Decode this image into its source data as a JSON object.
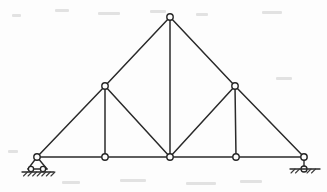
{
  "figure": {
    "type": "truss-line-diagram",
    "canvas": {
      "width": 327,
      "height": 192
    },
    "background_color": "#fdfdfd",
    "member_color": "#2a2a2a",
    "joint_fill_color": "#fdfdfd",
    "joint_stroke_color": "#242424",
    "member_stroke_width": 1.5,
    "joint_radius": 3.2
  },
  "joints": [
    {
      "id": "A",
      "name": "left-support-joint",
      "x": 37,
      "y": 157,
      "label": ""
    },
    {
      "id": "B",
      "name": "bottom-left-joint",
      "x": 105,
      "y": 157,
      "label": ""
    },
    {
      "id": "C",
      "name": "bottom-center-joint",
      "x": 170,
      "y": 157,
      "label": ""
    },
    {
      "id": "D",
      "name": "bottom-right-joint",
      "x": 236,
      "y": 157,
      "label": ""
    },
    {
      "id": "E",
      "name": "right-support-joint",
      "x": 304,
      "y": 157,
      "label": ""
    },
    {
      "id": "F",
      "name": "upper-left-joint",
      "x": 105,
      "y": 86,
      "label": ""
    },
    {
      "id": "G",
      "name": "apex-joint",
      "x": 170,
      "y": 17,
      "label": ""
    },
    {
      "id": "H",
      "name": "upper-right-joint",
      "x": 235,
      "y": 86,
      "label": ""
    }
  ],
  "members": [
    {
      "id": "m1",
      "name": "bottom-chord-A-B",
      "from": "A",
      "to": "B",
      "group": "bottom-chord"
    },
    {
      "id": "m2",
      "name": "bottom-chord-B-C",
      "from": "B",
      "to": "C",
      "group": "bottom-chord"
    },
    {
      "id": "m3",
      "name": "bottom-chord-C-D",
      "from": "C",
      "to": "D",
      "group": "bottom-chord"
    },
    {
      "id": "m4",
      "name": "bottom-chord-D-E",
      "from": "D",
      "to": "E",
      "group": "bottom-chord"
    },
    {
      "id": "m5",
      "name": "top-chord-A-F",
      "from": "A",
      "to": "F",
      "group": "top-chord"
    },
    {
      "id": "m6",
      "name": "top-chord-F-G",
      "from": "F",
      "to": "G",
      "group": "top-chord"
    },
    {
      "id": "m7",
      "name": "top-chord-G-H",
      "from": "G",
      "to": "H",
      "group": "top-chord"
    },
    {
      "id": "m8",
      "name": "top-chord-H-E",
      "from": "H",
      "to": "E",
      "group": "top-chord"
    },
    {
      "id": "m9",
      "name": "vertical-web-F-B",
      "from": "F",
      "to": "B",
      "group": "web-vertical"
    },
    {
      "id": "m10",
      "name": "vertical-web-G-C",
      "from": "G",
      "to": "C",
      "group": "web-vertical"
    },
    {
      "id": "m11",
      "name": "vertical-web-H-D",
      "from": "H",
      "to": "D",
      "group": "web-vertical"
    },
    {
      "id": "m12",
      "name": "diagonal-web-F-C",
      "from": "F",
      "to": "C",
      "group": "web-diagonal"
    },
    {
      "id": "m13",
      "name": "diagonal-web-C-H",
      "from": "C",
      "to": "H",
      "group": "web-diagonal"
    }
  ],
  "supports": {
    "left": {
      "name": "pinned-roller-support",
      "type": "pin-on-rollers",
      "joint": "A",
      "apex": {
        "x": 37,
        "y": 157
      },
      "base_left": {
        "x": 28,
        "y": 169
      },
      "base_right": {
        "x": 47,
        "y": 169
      },
      "rollers": [
        {
          "cx": 31,
          "cy": 169,
          "r": 2.6
        },
        {
          "cx": 43,
          "cy": 169,
          "r": 2.6
        }
      ],
      "ground": {
        "x1": 22,
        "y1": 172,
        "x2": 54,
        "y2": 172
      },
      "hatch_marks": 7,
      "label": ""
    },
    "right": {
      "name": "roller-support",
      "type": "roller",
      "joint": "E",
      "stem": {
        "x1": 304,
        "y1": 157,
        "x2": 304,
        "y2": 166
      },
      "roller": {
        "cx": 304,
        "cy": 169,
        "r": 3.0
      },
      "ground": {
        "x1": 290,
        "y1": 169,
        "x2": 320,
        "y2": 169
      },
      "hatch_marks": 5,
      "label": ""
    }
  },
  "annotations": {
    "dimension_labels": [],
    "load_arrows": [],
    "node_labels": [],
    "caption": ""
  }
}
